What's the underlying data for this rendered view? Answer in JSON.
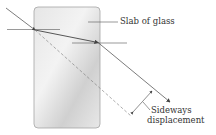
{
  "labels": {
    "slab": "Slab of glass",
    "displacement_line1": "Sideways",
    "displacement_line2": "displacement"
  },
  "colors": {
    "slab_fill_light": "#eeeeee",
    "slab_fill_dark": "#c9c9c9",
    "slab_border": "#999999",
    "ray": "#444444",
    "dashed": "#777777"
  }
}
